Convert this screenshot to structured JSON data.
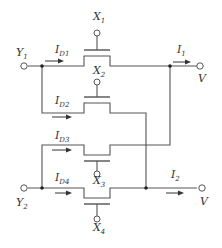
{
  "diagram": {
    "type": "circuit",
    "inputs": [
      {
        "id": "Y1",
        "label": "Y",
        "sub": "1"
      },
      {
        "id": "Y2",
        "label": "Y",
        "sub": "2"
      }
    ],
    "gates": [
      {
        "id": "X1",
        "label": "X",
        "sub": "1"
      },
      {
        "id": "X2",
        "label": "X",
        "sub": "2"
      },
      {
        "id": "X3",
        "label": "X",
        "sub": "3"
      },
      {
        "id": "X4",
        "label": "X",
        "sub": "4"
      }
    ],
    "drain_currents": [
      {
        "id": "ID1",
        "label": "I",
        "sub": "D1"
      },
      {
        "id": "ID2",
        "label": "I",
        "sub": "D2"
      },
      {
        "id": "ID3",
        "label": "I",
        "sub": "D3"
      },
      {
        "id": "ID4",
        "label": "I",
        "sub": "D4"
      }
    ],
    "outputs": [
      {
        "id": "I1",
        "label": "I",
        "sub": "1",
        "terminal": "V"
      },
      {
        "id": "I2",
        "label": "I",
        "sub": "2",
        "terminal": "V"
      }
    ],
    "colors": {
      "line": "#555555",
      "text": "#333333",
      "background": "#ffffff"
    }
  }
}
